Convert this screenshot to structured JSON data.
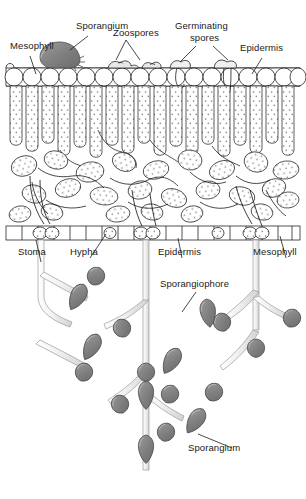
{
  "diagram": {
    "background_color": "#ffffff",
    "ink_color": "#1a1a1a",
    "sporangium_fill": "#808080",
    "sporangium_stroke": "#4a4a4a",
    "hypha_fill": "#f2f2f2",
    "cell_fill": "#ffffff"
  },
  "labels": {
    "mesophyll_top": "Mesophyll",
    "sporangium_top": "Sporangium",
    "zoospores": "Zoospores",
    "germinating_spores_line1": "Germinating",
    "germinating_spores_line2": "spores",
    "epidermis_top": "Epidermis",
    "stoma": "Stoma",
    "hypha": "Hypha",
    "epidermis_bottom": "Epidermis",
    "mesophyll_bottom": "Mesophyll",
    "sporangiophore": "Sporangiophore",
    "sporangium_bottom": "Sporangium"
  },
  "structures": {
    "upper_epidermis": "row of rounded epidermal cells along leaf top",
    "palisade_mesophyll": "tall columnar cells beneath upper epidermis",
    "spongy_mesophyll": "irregular rounded cells with air spaces",
    "lower_epidermis": "row of flattened epidermal cells with stomata",
    "intercellular_hyphae": "fungal threads running between mesophyll cells",
    "sporangiophores": "branched stalks emerging through stomata bearing sporangia"
  }
}
